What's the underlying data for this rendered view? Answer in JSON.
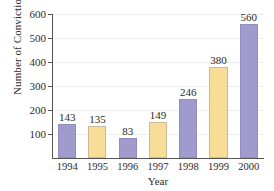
{
  "chart_data": {
    "type": "bar",
    "title": "",
    "xlabel": "Year",
    "ylabel": "Number of Convictions",
    "categories": [
      "1994",
      "1995",
      "1996",
      "1997",
      "1998",
      "1999",
      "2000"
    ],
    "values": [
      143,
      135,
      83,
      149,
      246,
      380,
      560
    ],
    "value_labels": [
      "143",
      "135",
      "83",
      "149",
      "246",
      "380",
      "560"
    ],
    "bar_colors": [
      "#9f9bcd",
      "#f8dd96",
      "#9f9bcd",
      "#f8dd96",
      "#9f9bcd",
      "#f8dd96",
      "#9f9bcd"
    ],
    "ylim": [
      0,
      600
    ],
    "yticks": [
      100,
      200,
      300,
      400,
      500,
      600
    ],
    "ytick_labels": [
      "100",
      "200",
      "300",
      "400",
      "500",
      "600"
    ],
    "grid": true,
    "legend": "none",
    "palette": {
      "purple": "#9f9bcd",
      "yellow": "#f8dd96",
      "axis": "#555555",
      "gridline": "#ededed",
      "text": "#2b2b2b",
      "background": "#ffffff"
    }
  }
}
